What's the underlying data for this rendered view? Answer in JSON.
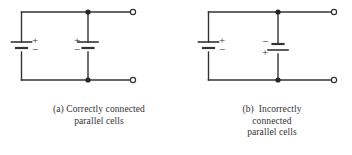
{
  "figure": {
    "type": "circuit-diagram",
    "background_color": "#ffffff",
    "line_color": "#333333",
    "text_color": "#333333",
    "panels": [
      {
        "id": "a",
        "label": "(a)",
        "caption_lines": [
          "(a) Correctly connected",
          "parallel cells"
        ],
        "caption_full": "(a) Correctly connected parallel cells",
        "cells": [
          {
            "name": "left-cell",
            "orientation": "positive-up",
            "plus_label": "+",
            "minus_label": "−",
            "plus_position": "top",
            "minus_position": "bottom"
          },
          {
            "name": "middle-cell",
            "orientation": "positive-up",
            "plus_label": "+",
            "minus_label": "−",
            "plus_position": "top",
            "minus_position": "bottom"
          }
        ],
        "terminals": [
          "top-right-open-terminal",
          "bottom-right-open-terminal"
        ],
        "junctions": [
          "top-junction-dot",
          "bottom-junction-dot"
        ]
      },
      {
        "id": "b",
        "label": "(b)",
        "caption_lines": [
          "(b)  Incorrectly",
          "connected",
          "parallel cells"
        ],
        "caption_full": "(b) Incorrectly connected parallel cells",
        "cells": [
          {
            "name": "left-cell",
            "orientation": "positive-up",
            "plus_label": "+",
            "minus_label": "−",
            "plus_position": "top",
            "minus_position": "bottom"
          },
          {
            "name": "middle-cell",
            "orientation": "positive-down",
            "plus_label": "+",
            "minus_label": "−",
            "plus_position": "bottom",
            "minus_position": "top"
          }
        ],
        "terminals": [
          "top-right-open-terminal",
          "bottom-right-open-terminal"
        ],
        "junctions": [
          "top-junction-dot",
          "bottom-junction-dot"
        ]
      }
    ]
  }
}
